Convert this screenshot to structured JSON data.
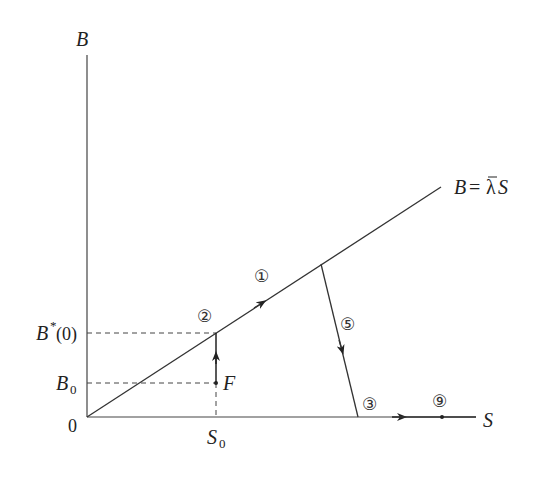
{
  "diagram": {
    "type": "phase-diagram",
    "axes": {
      "y_label": "B",
      "x_label": "S",
      "origin_label": "0"
    },
    "line_label": {
      "lhs": "B",
      "eq": "=",
      "lambda": "λ",
      "rhs": "S"
    },
    "ticks": {
      "b_star": {
        "main": "B",
        "sup": "*",
        "arg": "(0)"
      },
      "b0": {
        "main": "B",
        "sub": "0"
      },
      "s0": {
        "main": "S",
        "sub": "0"
      }
    },
    "point_F": "F",
    "markers": {
      "m1": "①",
      "m2": "②",
      "m3": "③",
      "m5": "⑤",
      "m9": "⑨"
    },
    "colors": {
      "stroke": "#333333",
      "text": "#222222"
    }
  }
}
